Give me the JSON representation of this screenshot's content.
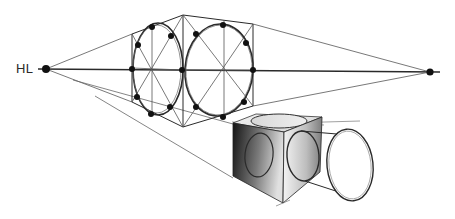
{
  "diagram": {
    "horizon_line": {
      "label": "HL",
      "left_vanishing_point": {
        "x": 46,
        "y": 69
      },
      "right_vanishing_point": {
        "x": 430,
        "y": 72
      }
    },
    "elements": [
      {
        "name": "horizon-line",
        "label": "HL"
      },
      {
        "name": "left-vanishing-point"
      },
      {
        "name": "right-vanishing-point"
      },
      {
        "name": "construction-box-left-face-ellipse",
        "points_marked": 8
      },
      {
        "name": "construction-box-right-face-ellipse",
        "points_marked": 8
      },
      {
        "name": "shaded-cube",
        "faces_with_ellipses": 3
      },
      {
        "name": "cylinder-extending-from-cube"
      }
    ],
    "colors": {
      "line": "#2a2a2a",
      "light_line": "#777777",
      "dot": "#111111",
      "cube_dark": "#1a1a1a",
      "cube_light": "#f2f2f2"
    }
  }
}
